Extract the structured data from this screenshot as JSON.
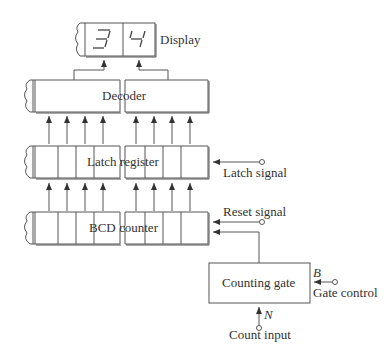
{
  "display": {
    "label": "Display",
    "digits": [
      "3",
      "4"
    ]
  },
  "decoder": {
    "label": "Decoder"
  },
  "latch": {
    "label": "Latch register",
    "signal_label": "Latch signal"
  },
  "counter": {
    "label": "BCD counter",
    "reset_label": "Reset signal"
  },
  "gate": {
    "label": "Counting gate",
    "control_label": "Gate control",
    "control_symbol": "B",
    "input_symbol": "N",
    "input_label": "Count input"
  },
  "colors": {
    "line": "#555555",
    "text": "#333333",
    "background": "#ffffff"
  }
}
